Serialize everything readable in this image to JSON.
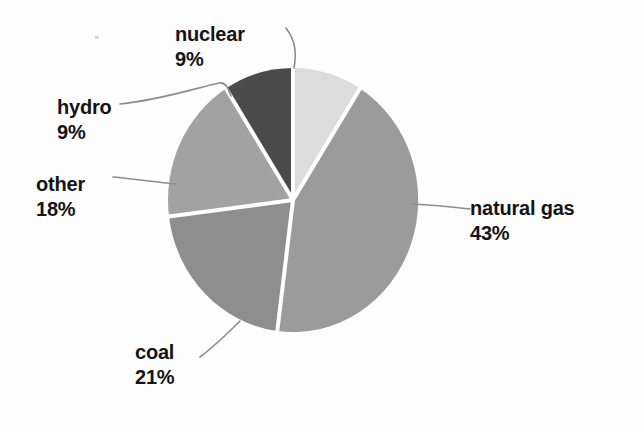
{
  "chart_data": {
    "type": "pie",
    "title": "",
    "subtitle": "",
    "xlabel": "",
    "ylabel": "",
    "grid": false,
    "legend_position": "none",
    "labels_position": "outside-with-leader-lines",
    "total_percent": 100,
    "categories": [
      "nuclear",
      "natural gas",
      "coal",
      "other",
      "hydro"
    ],
    "values": [
      9,
      43,
      21,
      18,
      9
    ],
    "value_unit": "%",
    "slices": [
      {
        "name": "nuclear",
        "value": 9,
        "label_name": "nuclear",
        "label_value": "9%",
        "color": "#dcdcdc",
        "start_angle_deg": 0,
        "end_angle_deg": 32.4
      },
      {
        "name": "natural gas",
        "value": 43,
        "label_name": "natural gas",
        "label_value": "43%",
        "color": "#9b9b9b",
        "start_angle_deg": 32.4,
        "end_angle_deg": 187.2
      },
      {
        "name": "coal",
        "value": 21,
        "label_name": "coal",
        "label_value": "21%",
        "color": "#8e8e8e",
        "start_angle_deg": 187.2,
        "end_angle_deg": 262.8
      },
      {
        "name": "other",
        "value": 18,
        "label_name": "other",
        "label_value": "18%",
        "color": "#a2a2a2",
        "start_angle_deg": 262.8,
        "end_angle_deg": 327.6
      },
      {
        "name": "hydro",
        "value": 9,
        "label_name": "hydro",
        "label_value": "9%",
        "color": "#4b4b4b",
        "start_angle_deg": 327.6,
        "end_angle_deg": 360
      }
    ],
    "separator_color": "#ffffff",
    "leader_line_color": "#8a8a8a",
    "background_color": "#fdfdfd",
    "text_color": "#141414"
  },
  "labels": {
    "nuclear": {
      "name": "nuclear",
      "value": "9%"
    },
    "hydro": {
      "name": "hydro",
      "value": "9%"
    },
    "other": {
      "name": "other",
      "value": "18%"
    },
    "natural_gas": {
      "name": "natural gas",
      "value": "43%"
    },
    "coal": {
      "name": "coal",
      "value": "21%"
    }
  }
}
